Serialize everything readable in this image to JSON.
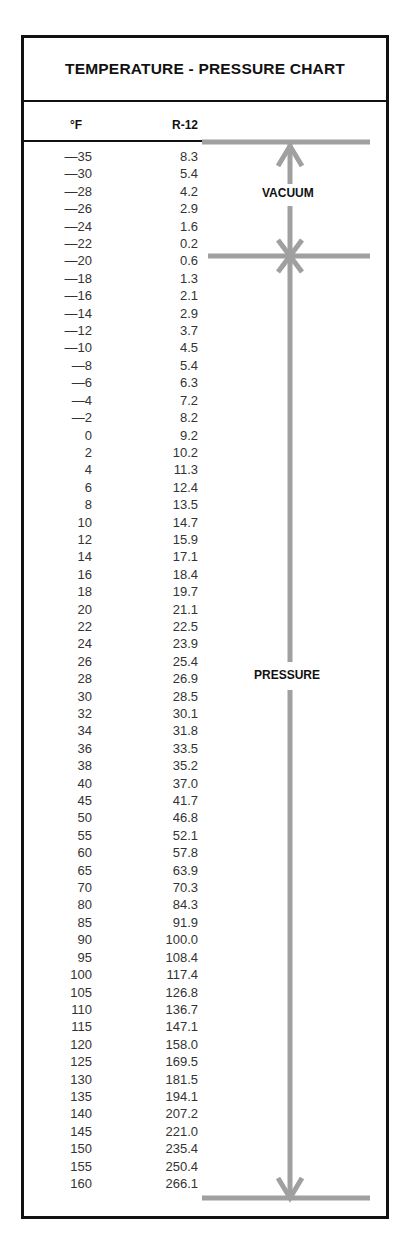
{
  "title": "TEMPERATURE - PRESSURE CHART",
  "columns": {
    "temperature": "°F",
    "refrigerant": "R-12"
  },
  "labels": {
    "vacuum": "VACUUM",
    "pressure": "PRESSURE"
  },
  "colors": {
    "frame": "#111111",
    "arrow": "#a0a0a0",
    "text": "#333333"
  },
  "rows": [
    {
      "t": "—35",
      "p": "8.3"
    },
    {
      "t": "—30",
      "p": "5.4"
    },
    {
      "t": "—28",
      "p": "4.2"
    },
    {
      "t": "—26",
      "p": "2.9"
    },
    {
      "t": "—24",
      "p": "1.6"
    },
    {
      "t": "—22",
      "p": "0.2"
    },
    {
      "t": "—20",
      "p": "0.6"
    },
    {
      "t": "—18",
      "p": "1.3"
    },
    {
      "t": "—16",
      "p": "2.1"
    },
    {
      "t": "—14",
      "p": "2.9"
    },
    {
      "t": "—12",
      "p": "3.7"
    },
    {
      "t": "—10",
      "p": "4.5"
    },
    {
      "t": "—8",
      "p": "5.4"
    },
    {
      "t": "—6",
      "p": "6.3"
    },
    {
      "t": "—4",
      "p": "7.2"
    },
    {
      "t": "—2",
      "p": "8.2"
    },
    {
      "t": "0",
      "p": "9.2"
    },
    {
      "t": "2",
      "p": "10.2"
    },
    {
      "t": "4",
      "p": "11.3"
    },
    {
      "t": "6",
      "p": "12.4"
    },
    {
      "t": "8",
      "p": "13.5"
    },
    {
      "t": "10",
      "p": "14.7"
    },
    {
      "t": "12",
      "p": "15.9"
    },
    {
      "t": "14",
      "p": "17.1"
    },
    {
      "t": "16",
      "p": "18.4"
    },
    {
      "t": "18",
      "p": "19.7"
    },
    {
      "t": "20",
      "p": "21.1"
    },
    {
      "t": "22",
      "p": "22.5"
    },
    {
      "t": "24",
      "p": "23.9"
    },
    {
      "t": "26",
      "p": "25.4"
    },
    {
      "t": "28",
      "p": "26.9"
    },
    {
      "t": "30",
      "p": "28.5"
    },
    {
      "t": "32",
      "p": "30.1"
    },
    {
      "t": "34",
      "p": "31.8"
    },
    {
      "t": "36",
      "p": "33.5"
    },
    {
      "t": "38",
      "p": "35.2"
    },
    {
      "t": "40",
      "p": "37.0"
    },
    {
      "t": "45",
      "p": "41.7"
    },
    {
      "t": "50",
      "p": "46.8"
    },
    {
      "t": "55",
      "p": "52.1"
    },
    {
      "t": "60",
      "p": "57.8"
    },
    {
      "t": "65",
      "p": "63.9"
    },
    {
      "t": "70",
      "p": "70.3"
    },
    {
      "t": "80",
      "p": "84.3"
    },
    {
      "t": "85",
      "p": "91.9"
    },
    {
      "t": "90",
      "p": "100.0"
    },
    {
      "t": "95",
      "p": "108.4"
    },
    {
      "t": "100",
      "p": "117.4"
    },
    {
      "t": "105",
      "p": "126.8"
    },
    {
      "t": "110",
      "p": "136.7"
    },
    {
      "t": "115",
      "p": "147.1"
    },
    {
      "t": "120",
      "p": "158.0"
    },
    {
      "t": "125",
      "p": "169.5"
    },
    {
      "t": "130",
      "p": "181.5"
    },
    {
      "t": "135",
      "p": "194.1"
    },
    {
      "t": "140",
      "p": "207.2"
    },
    {
      "t": "145",
      "p": "221.0"
    },
    {
      "t": "150",
      "p": "235.4"
    },
    {
      "t": "155",
      "p": "250.4"
    },
    {
      "t": "160",
      "p": "266.1"
    }
  ]
}
